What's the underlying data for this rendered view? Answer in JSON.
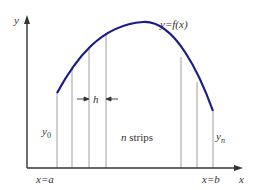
{
  "diagram": {
    "labels": {
      "y_axis": "y",
      "x_axis": "x",
      "curve": "y=f(x)",
      "h": "h",
      "y0": "y",
      "y0_sub": "0",
      "yn": "y",
      "yn_sub": "n",
      "strips_n": "n",
      "strips_text": " strips",
      "x_a": "x=a",
      "x_b": "x=b"
    },
    "colors": {
      "curve": "#1a1a8c",
      "axes": "#333333",
      "strip_lines": "#999999",
      "text": "#333333"
    },
    "strip_x_positions": [
      57,
      72,
      89,
      106,
      181,
      197,
      213
    ],
    "curve_y_at_strips": [
      93,
      67,
      47,
      33,
      57,
      82,
      111
    ]
  }
}
